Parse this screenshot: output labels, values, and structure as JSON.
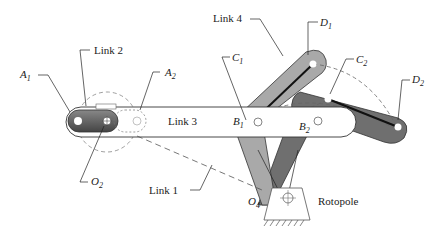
{
  "diagram": {
    "type": "mechanism",
    "title": "",
    "labels": {
      "link1": "Link 1",
      "link2": "Link 2",
      "link3": "Link 3",
      "link4": "Link 4",
      "a1": "A",
      "a1_sub": "1",
      "a2": "A",
      "a2_sub": "2",
      "b1": "B",
      "b1_sub": "1",
      "b2": "B",
      "b2_sub": "2",
      "c1": "C",
      "c1_sub": "1",
      "c2": "C",
      "c2_sub": "2",
      "d1": "D",
      "d1_sub": "1",
      "d2": "D",
      "d2_sub": "2",
      "o2": "O",
      "o2_sub": "2",
      "o4": "O",
      "o4_sub": "4",
      "rotopole": "Rotopole"
    },
    "colors": {
      "link4_pos1": "#a9a9a9",
      "link4_pos2": "#6f6f6f",
      "link3": "#ffffff",
      "link2": "#555555",
      "outline": "#333333"
    }
  }
}
